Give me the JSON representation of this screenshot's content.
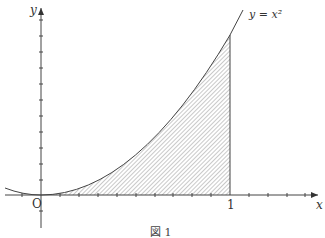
{
  "figure": {
    "caption": "図 1",
    "curve_label": "y = x²",
    "x_axis_label": "x",
    "y_axis_label": "y",
    "origin_label": "O",
    "x_tick_label": "1"
  },
  "colors": {
    "line": "#444444",
    "hatch": "#777777",
    "background": "#ffffff"
  }
}
